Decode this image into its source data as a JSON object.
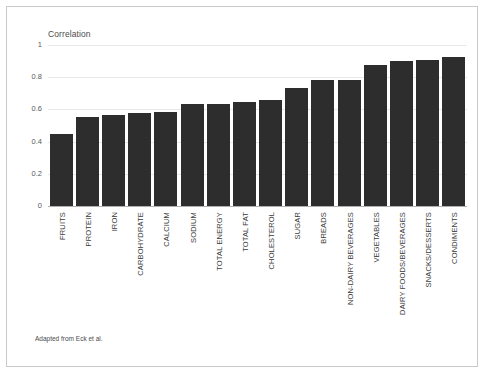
{
  "figure": {
    "caption": "Adapted from Eck et al.",
    "frame_color": "#c9c9c9",
    "background": "#ffffff"
  },
  "chart_data": {
    "type": "bar",
    "title": "Correlation",
    "xlabel": "",
    "ylabel": "",
    "ylim": [
      0,
      1
    ],
    "grid": true,
    "legend": null,
    "bar_color": "#2d2d2d",
    "yticks": [
      "0",
      "0.2",
      "0.4",
      "0.6",
      "0.8",
      "1"
    ],
    "ytick_values": [
      0,
      0.2,
      0.4,
      0.6,
      0.8,
      1
    ],
    "categories": [
      "FRUITS",
      "PROTEIN",
      "IRON",
      "CARBOHYDRATE",
      "CALCIUM",
      "SODIUM",
      "TOTAL ENERGY",
      "TOTAL FAT",
      "CHOLESTEROL",
      "SUGAR",
      "BREADS",
      "NON-DAIRY BEVERAGES",
      "VEGETABLES",
      "DAIRY FOODS/BEVERAGES",
      "SNACKS/DESSERTS",
      "CONDIMENTS"
    ],
    "values": [
      0.45,
      0.555,
      0.565,
      0.575,
      0.585,
      0.635,
      0.635,
      0.645,
      0.66,
      0.73,
      0.785,
      0.785,
      0.875,
      0.9,
      0.905,
      0.925
    ]
  }
}
